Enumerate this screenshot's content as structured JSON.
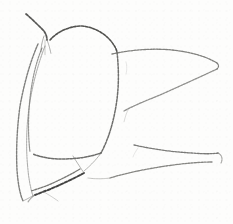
{
  "artwork": {
    "title": "Pencil line sketch",
    "medium": "graphite pencil on white paper",
    "subject": "abstract organic botanical form",
    "canvas": {
      "width": 233,
      "height": 224
    },
    "background_color": "#fdfdfc",
    "ink_color": "#5b5b58",
    "ink_color_dark": "#2e2e2c",
    "ink_color_faint": "#9a9a97"
  },
  "strokes": [
    {
      "name": "upper-left-diagonal-stroke",
      "d": "M 26 14 C 32 19, 38 25, 44 31 C 46 34, 47 37, 47 40",
      "color": "#3a3a37",
      "width": 1.7,
      "opacity": 0.85
    },
    {
      "name": "junction-tick-left",
      "d": "M 44 36 C 42 42, 41 47, 41 52",
      "color": "#6e6e6b",
      "width": 1.0,
      "opacity": 0.6
    },
    {
      "name": "junction-tick-right",
      "d": "M 47 40 C 49 45, 50 49, 51 54",
      "color": "#6e6e6b",
      "width": 1.0,
      "opacity": 0.55
    },
    {
      "name": "junction-tick-center",
      "d": "M 45 40 C 45 46, 45 50, 45 55",
      "color": "#82827f",
      "width": 0.9,
      "opacity": 0.45
    },
    {
      "name": "central-body-top-arch",
      "d": "M 50 40 C 58 31, 70 26, 82 26 C 93 27, 103 32, 111 41 C 114 45, 116 48, 117 52",
      "color": "#3f3f3c",
      "width": 1.6,
      "opacity": 0.9
    },
    {
      "name": "central-body-right-edge",
      "d": "M 117 52 C 119 70, 119 88, 116 106 C 113 124, 108 140, 101 153",
      "color": "#565653",
      "width": 1.5,
      "opacity": 0.85
    },
    {
      "name": "central-body-bottom-edge",
      "d": "M 101 153 C 90 157, 76 159, 62 159 C 50 159, 40 157, 33 154",
      "color": "#4a4a47",
      "width": 1.5,
      "opacity": 0.8
    },
    {
      "name": "central-body-left-edge-inner",
      "d": "M 42 48 C 36 62, 32 80, 30 98 C 28 116, 28 136, 30 152",
      "color": "#6a6a67",
      "width": 1.2,
      "opacity": 0.7
    },
    {
      "name": "stem-line-outer-left",
      "d": "M 38 44 C 30 62, 24 84, 20 106 C 17 128, 16 150, 17 170 C 18 184, 20 194, 23 201",
      "color": "#5f5f5c",
      "width": 1.4,
      "opacity": 0.8
    },
    {
      "name": "stem-line-inner-left",
      "d": "M 45 46 C 38 64, 32 86, 29 108 C 26 130, 26 152, 28 170 C 29 181, 31 190, 33 196",
      "color": "#7c7c79",
      "width": 1.1,
      "opacity": 0.6
    },
    {
      "name": "stem-join-bottom",
      "d": "M 23 201 C 27 199, 31 197, 34 195",
      "color": "#797976",
      "width": 1.0,
      "opacity": 0.55
    },
    {
      "name": "upper-leaf-top-edge",
      "d": "M 112 54 C 130 50, 152 48, 172 50 C 192 52, 207 57, 217 63",
      "color": "#61615e",
      "width": 1.3,
      "opacity": 0.8
    },
    {
      "name": "upper-leaf-tip-hook",
      "d": "M 217 63 C 219 65, 219 67, 217 69",
      "color": "#50504d",
      "width": 1.2,
      "opacity": 0.75
    },
    {
      "name": "upper-leaf-bottom-edge",
      "d": "M 217 69 C 200 77, 180 86, 160 95 C 145 101, 133 106, 124 111",
      "color": "#6b6b68",
      "width": 1.3,
      "opacity": 0.75
    },
    {
      "name": "upper-leaf-inner-vein",
      "d": "M 128 110 C 126 114, 125 118, 124 122",
      "color": "#9a9a97",
      "width": 0.9,
      "opacity": 0.4
    },
    {
      "name": "lower-leaf-top-edge",
      "d": "M 134 145 C 152 149, 172 152, 192 153 C 204 154, 212 154, 218 153",
      "color": "#585855",
      "width": 1.3,
      "opacity": 0.8
    },
    {
      "name": "lower-leaf-tip-hook",
      "d": "M 218 153 C 222 155, 223 159, 221 163",
      "color": "#6e6e6b",
      "width": 1.1,
      "opacity": 0.65
    },
    {
      "name": "lower-leaf-bottom-edge",
      "d": "M 110 178 C 126 173, 146 169, 166 166 C 186 163, 202 162, 212 162",
      "color": "#5d5d5a",
      "width": 1.3,
      "opacity": 0.75
    },
    {
      "name": "lower-leaf-base-connector",
      "d": "M 110 178 C 103 179, 95 179, 88 178",
      "color": "#8b8b88",
      "width": 1.0,
      "opacity": 0.5
    },
    {
      "name": "bottom-wedge-upper-stroke",
      "d": "M 80 169 C 70 175, 58 181, 46 186 C 40 188, 35 190, 31 191",
      "color": "#4d4d4a",
      "width": 1.3,
      "opacity": 0.75
    },
    {
      "name": "bottom-wedge-dark-stroke",
      "d": "M 84 173 C 73 179, 60 185, 48 190 C 42 192, 38 194, 35 195",
      "color": "#2e2e2c",
      "width": 1.9,
      "opacity": 0.9
    },
    {
      "name": "bottom-wedge-branch",
      "d": "M 84 173 C 80 167, 76 161, 73 156",
      "color": "#73736f",
      "width": 1.0,
      "opacity": 0.55
    },
    {
      "name": "bottom-wedge-tail",
      "d": "M 35 195 C 32 197, 30 199, 28 202",
      "color": "#6a6a67",
      "width": 1.1,
      "opacity": 0.6
    },
    {
      "name": "bottom-loose-hatch",
      "d": "M 44 192 C 49 195, 54 198, 58 201",
      "color": "#8e8e8b",
      "width": 0.9,
      "opacity": 0.45
    },
    {
      "name": "central-body-lower-crease",
      "d": "M 101 153 C 96 160, 90 166, 84 171",
      "color": "#7a7a77",
      "width": 1.0,
      "opacity": 0.55
    },
    {
      "name": "right-faint-speck-upper",
      "d": "M 126 62 C 127 66, 127 70, 126 74",
      "color": "#a5a5a2",
      "width": 0.8,
      "opacity": 0.3
    },
    {
      "name": "right-faint-speck-lower",
      "d": "M 138 148 C 136 151, 134 154, 133 157",
      "color": "#a5a5a2",
      "width": 0.8,
      "opacity": 0.3
    }
  ]
}
